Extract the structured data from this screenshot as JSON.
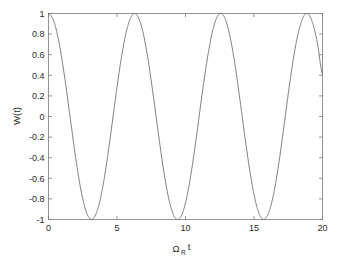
{
  "figure": {
    "background_color": "#ffffff",
    "axis_color": "#7a7a7a",
    "text_color": "#2b2b2b",
    "curve_color": "#6e6e6e"
  },
  "chart_data": {
    "type": "line",
    "title": "",
    "xlabel": "Ω",
    "xlabel_subscript": "R",
    "xlabel_suffix": "t",
    "xlabel_full": "Ωᴿ t",
    "ylabel": "W(t)",
    "xlim": [
      0,
      20
    ],
    "ylim": [
      -1,
      1
    ],
    "xticks": [
      0,
      5,
      10,
      15,
      20
    ],
    "xticklabels": [
      "0",
      "5",
      "10",
      "15",
      "20"
    ],
    "yticks": [
      -1,
      -0.8,
      -0.6,
      -0.4,
      -0.2,
      0,
      0.2,
      0.4,
      0.6,
      0.8,
      1
    ],
    "yticklabels": [
      "-1",
      "-0.8",
      "-0.6",
      "-0.4",
      "-0.2",
      "0",
      "0.2",
      "0.4",
      "0.6",
      "0.8",
      "1"
    ],
    "grid": false,
    "legend": null,
    "series": [
      {
        "name": "W(t)",
        "formula": "cos(t)",
        "color": "#6e6e6e",
        "linewidth": 0.9,
        "x": [
          0,
          0.4,
          0.8,
          1.2,
          1.6,
          2,
          2.4,
          2.8,
          3.2,
          3.6,
          4,
          4.4,
          4.8,
          5.2,
          5.6,
          6,
          6.4,
          6.8,
          7.2,
          7.6,
          8,
          8.4,
          8.8,
          9.2,
          9.6,
          10,
          10.4,
          10.8,
          11.2,
          11.6,
          12,
          12.4,
          12.8,
          13.2,
          13.6,
          14,
          14.4,
          14.8,
          15.2,
          15.6,
          16,
          16.4,
          16.8,
          17.2,
          17.6,
          18,
          18.4,
          18.8,
          19.2,
          19.6,
          20
        ],
        "y": [
          1,
          0.921,
          0.697,
          0.362,
          -0.029,
          -0.416,
          -0.737,
          -0.942,
          -0.998,
          -0.896,
          -0.654,
          -0.307,
          0.087,
          0.469,
          0.776,
          0.96,
          0.993,
          0.869,
          0.608,
          0.251,
          -0.146,
          -0.519,
          -0.811,
          -0.975,
          -0.985,
          -0.839,
          -0.559,
          -0.193,
          0.205,
          0.567,
          0.844,
          0.986,
          0.975,
          0.807,
          0.513,
          0.137,
          -0.26,
          -0.613,
          -0.872,
          -0.994,
          -0.958,
          -0.772,
          -0.465,
          -0.081,
          0.316,
          0.66,
          0.896,
          0.999,
          0.938,
          0.731,
          0.408
        ]
      }
    ],
    "peaks": [
      {
        "x": 0,
        "y": 1
      },
      {
        "x": 6.283,
        "y": 1
      },
      {
        "x": 12.566,
        "y": 1
      },
      {
        "x": 18.85,
        "y": 1
      }
    ],
    "troughs": [
      {
        "x": 3.142,
        "y": -1
      },
      {
        "x": 9.425,
        "y": -1
      },
      {
        "x": 15.708,
        "y": -1
      }
    ],
    "period": 6.283,
    "endpoint_value": 0.408
  }
}
